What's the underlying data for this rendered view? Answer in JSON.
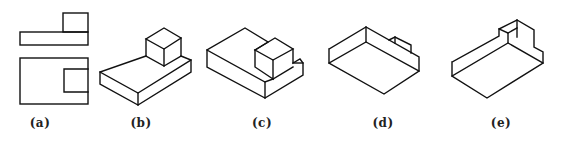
{
  "figures": [
    {
      "id": "a",
      "label": "(a)",
      "type": "orthographic-views",
      "views": [
        "front-view",
        "top-view"
      ]
    },
    {
      "id": "b",
      "label": "(b)",
      "type": "isometric-solid",
      "description": "slab with cube on top"
    },
    {
      "id": "c",
      "label": "(c)",
      "type": "isometric-solid",
      "description": "slab with cube and notch at right"
    },
    {
      "id": "d",
      "label": "(d)",
      "type": "isometric-solid",
      "description": "slab seen from below with small tab"
    },
    {
      "id": "e",
      "label": "(e)",
      "type": "isometric-solid",
      "description": "slab seen from below with block at back right"
    }
  ],
  "colors": {
    "stroke": "#111111",
    "background": "#ffffff",
    "label": "#222222"
  }
}
